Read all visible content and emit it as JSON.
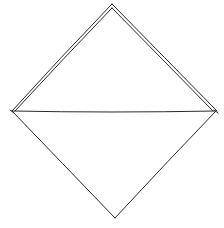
{
  "diagram": {
    "type": "line-drawing",
    "stroke_color": "#2a2a2a",
    "background": "#ffffff",
    "vertices": {
      "top": [
        112,
        5
      ],
      "left": [
        12,
        111
      ],
      "right": [
        216,
        111
      ],
      "bottom": [
        115,
        218
      ]
    },
    "edges": [
      {
        "from": "left",
        "to": "top",
        "style": "double"
      },
      {
        "from": "top",
        "to": "right",
        "style": "double"
      },
      {
        "from": "left",
        "to": "right",
        "style": "single"
      },
      {
        "from": "left",
        "to": "bottom",
        "style": "single"
      },
      {
        "from": "bottom",
        "to": "right",
        "style": "single"
      }
    ]
  }
}
